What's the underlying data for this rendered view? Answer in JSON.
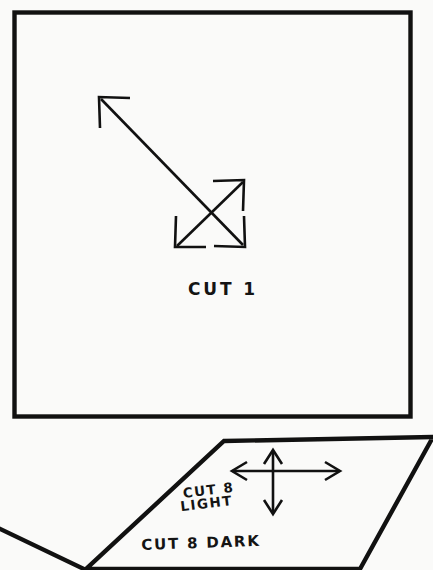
{
  "document": {
    "kind": "sewing-pattern-sheet",
    "background_color": "#fafaf9",
    "ink_color": "#111111"
  },
  "pieces": [
    {
      "id": "cut-1",
      "shape": "square",
      "label": "CUT 1",
      "grain_marker": "double-headed diagonal cross arrows"
    },
    {
      "id": "cut-8-light",
      "shape": "parallelogram",
      "label_line1": "CUT 8",
      "label_line2": "LIGHT",
      "grain_marker": "four-way cross arrow"
    },
    {
      "id": "cut-8-dark",
      "shape": "parallelogram",
      "label": "CUT 8 DARK"
    }
  ],
  "labels": {
    "cut_1": "CUT 1",
    "cut_8": "CUT 8",
    "light": "LIGHT",
    "cut_8_dark": "CUT 8 DARK"
  },
  "markers": {
    "diagonal_cross_arrow": "four-headed diagonal grainline arrow",
    "orthogonal_cross_arrow": "four-headed vertical and horizontal grainline arrow"
  }
}
